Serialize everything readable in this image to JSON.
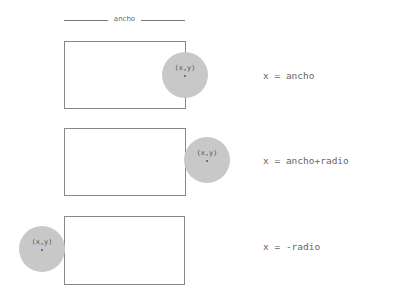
{
  "ruler": {
    "label": "ancho"
  },
  "cases": [
    {
      "circle_label": "(x,y)",
      "equation": "x = ancho"
    },
    {
      "circle_label": "(x,y)",
      "equation": "x = ancho+radio"
    },
    {
      "circle_label": "(x,y)",
      "equation": "x = -radio"
    }
  ],
  "colors": {
    "circle_fill": "#c8c8c8",
    "rect_border": "#888888",
    "text": "#666666"
  }
}
